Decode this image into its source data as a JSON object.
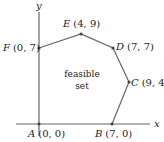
{
  "diagram": {
    "axes": {
      "x_label": "x",
      "y_label": "y",
      "origin_px": [
        39,
        124
      ],
      "x_end_px": 150,
      "y_top_px": 10
    },
    "region_label_line1": "feasible",
    "region_label_line2": "set",
    "vertices": [
      {
        "name": "A",
        "coords": "(0, 0)",
        "x": 0,
        "y": 0,
        "px": [
          39,
          124
        ]
      },
      {
        "name": "B",
        "coords": "(7, 0)",
        "x": 7,
        "y": 0,
        "px": [
          112,
          124
        ]
      },
      {
        "name": "C",
        "coords": "(9, 4)",
        "x": 9,
        "y": 4,
        "px": [
          129,
          82
        ]
      },
      {
        "name": "D",
        "coords": "(7, 7)",
        "x": 7,
        "y": 7,
        "px": [
          113,
          48
        ]
      },
      {
        "name": "E",
        "coords": "(4, 9)",
        "x": 4,
        "y": 9,
        "px": [
          81,
          34
        ]
      },
      {
        "name": "F",
        "coords": "(0, 7)",
        "x": 0,
        "y": 7,
        "px": [
          39,
          48
        ]
      }
    ],
    "colors": {
      "axis": "#555555",
      "edge": "#555555",
      "vertex": "#444444",
      "text": "#222222"
    }
  }
}
